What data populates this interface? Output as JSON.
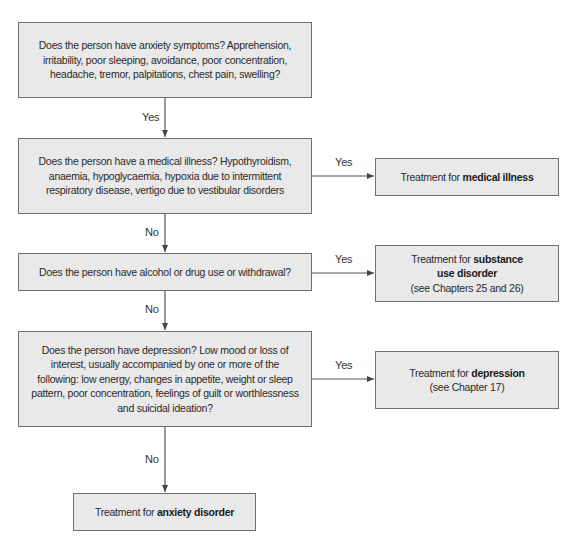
{
  "flowchart": {
    "questions": [
      {
        "id": "q1",
        "text": "Does the person have anxiety symptoms? Apprehension, irritability, poor sleeping, avoidance, poor concentration, headache, tremor, palpitations, chest pain, swelling?"
      },
      {
        "id": "q2",
        "text": "Does the person have a medical illness? Hypothyroidism, anaemia, hypoglycaemia, hypoxia due to intermittent respiratory disease, vertigo due to vestibular disorders"
      },
      {
        "id": "q3",
        "text": "Does the person have alcohol or drug use or withdrawal?"
      },
      {
        "id": "q4",
        "text": "Does the person have depression? Low mood or loss of interest, usually accompanied by one or more of the following: low energy, changes in appetite, weight or sleep pattern, poor concentration, feelings of guilt or worthlessness and suicidal ideation?"
      }
    ],
    "outcomes": {
      "medical": {
        "prefix": "Treatment for ",
        "bold": "medical illness",
        "note": ""
      },
      "substance": {
        "prefix": "Treatment for ",
        "bold": "substance use disorder",
        "note": "(see Chapters 25 and 26)"
      },
      "depression": {
        "prefix": "Treatment for ",
        "bold": "depression",
        "note": "(see Chapter 17)"
      },
      "anxiety": {
        "prefix": "Treatment for ",
        "bold": "anxiety disorder",
        "note": ""
      }
    },
    "edge_labels": {
      "q1_to_q2": "Yes",
      "q2_to_medical": "Yes",
      "q2_to_q3": "No",
      "q3_to_substance": "Yes",
      "q3_to_q4": "No",
      "q4_to_depression": "Yes",
      "q4_to_anxiety": "No"
    },
    "colors": {
      "box_fill": "#e9e9e9",
      "box_border": "#6e6e6e",
      "line": "#555555",
      "text": "#2a2a2a"
    }
  }
}
